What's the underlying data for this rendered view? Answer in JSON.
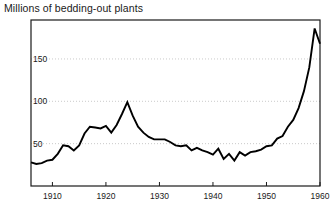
{
  "chart_data": {
    "type": "line",
    "title": "Millions of bedding-out plants",
    "xlabel": "",
    "ylabel": "",
    "xlim": [
      1906,
      1960
    ],
    "ylim": [
      0,
      196
    ],
    "grid": true,
    "legend": false,
    "legend_position": "none",
    "yticks": [
      50,
      100,
      150
    ],
    "ytick_labels": [
      "50",
      "100",
      "150"
    ],
    "xticks": [
      1910,
      1920,
      1930,
      1940,
      1950,
      1960
    ],
    "xtick_labels": [
      "1910",
      "1920",
      "1930",
      "1940",
      "1950",
      "1960"
    ],
    "line_color": "#000000",
    "series": [
      {
        "name": "Millions of bedding-out plants",
        "x": [
          1906,
          1907,
          1908,
          1909,
          1910,
          1911,
          1912,
          1913,
          1914,
          1915,
          1916,
          1917,
          1918,
          1919,
          1920,
          1921,
          1922,
          1923,
          1924,
          1925,
          1926,
          1927,
          1928,
          1929,
          1930,
          1931,
          1932,
          1933,
          1934,
          1935,
          1936,
          1937,
          1938,
          1939,
          1940,
          1941,
          1942,
          1943,
          1944,
          1945,
          1946,
          1947,
          1948,
          1949,
          1950,
          1951,
          1952,
          1953,
          1954,
          1955,
          1956,
          1957,
          1958,
          1959,
          1960
        ],
        "values": [
          28,
          26,
          27,
          30,
          31,
          38,
          48,
          47,
          42,
          48,
          62,
          70,
          69,
          68,
          71,
          63,
          72,
          85,
          99,
          83,
          70,
          63,
          58,
          55,
          55,
          55,
          52,
          48,
          47,
          48,
          42,
          45,
          42,
          40,
          37,
          44,
          32,
          38,
          30,
          40,
          36,
          40,
          41,
          43,
          47,
          48,
          56,
          59,
          70,
          78,
          92,
          112,
          140,
          186,
          168
        ]
      }
    ]
  }
}
